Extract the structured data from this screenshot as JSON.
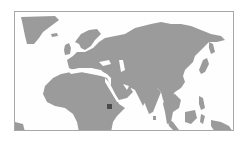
{
  "map": {
    "type": "locator-map",
    "region": "Eastern Hemisphere (Europe, Africa, Asia)",
    "land_color": "#9b9b9b",
    "water_color": "#fefefe",
    "frame_color": "#a8a8a8",
    "marker": {
      "label": "Horn of Africa (Ethiopia)",
      "color": "#4a4a4a",
      "x": 107,
      "y": 104
    }
  }
}
